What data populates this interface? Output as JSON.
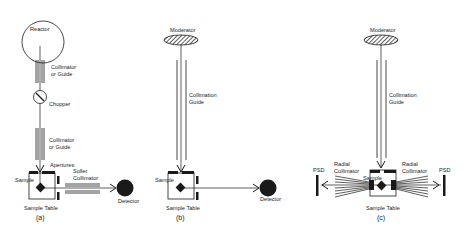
{
  "panels": [
    {
      "id": "a",
      "caption": "(a)",
      "labels": {
        "source": "Reactor",
        "collimator1_line1": "Collimator",
        "collimator1_line2": "or Guide",
        "chopper": "Chopper",
        "collimator2_line1": "Collimator",
        "collimator2_line2": "or Guide",
        "apertures": "Apertures",
        "sample": "Sample",
        "soller_line1": "Soller",
        "soller_line2": "Collimator",
        "detector": "Detector",
        "table": "Sample Table"
      }
    },
    {
      "id": "b",
      "caption": "(b)",
      "labels": {
        "source": "Moderator",
        "guide_line1": "Collimation",
        "guide_line2": "Guide",
        "sample": "Sample",
        "detector": "Detector",
        "table": "Sample Table"
      }
    },
    {
      "id": "c",
      "caption": "(c)",
      "labels": {
        "source": "Moderator",
        "guide_line1": "Collimation",
        "guide_line2": "Guide",
        "radial_left_line1": "Radial",
        "radial_left_line2": "Collimator",
        "radial_right_line1": "Radial",
        "radial_right_line2": "Collimator",
        "psd_left": "PSD",
        "psd_right": "PSD",
        "sample": "Sample",
        "table": "Sample Table"
      }
    }
  ],
  "colors": {
    "ink": "#1a1a1a",
    "background": "#ffffff"
  }
}
